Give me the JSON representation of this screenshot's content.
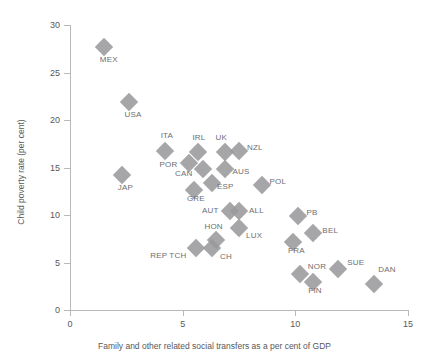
{
  "chart_data": {
    "type": "scatter",
    "title": "",
    "xlabel": "Family and other related social transfers as a per cent of GDP",
    "ylabel": "Child poverty rate (per cent)",
    "xlim": [
      0,
      15
    ],
    "ylim": [
      0,
      30
    ],
    "xticks": [
      0,
      5,
      10,
      15
    ],
    "yticks": [
      0,
      5,
      10,
      15,
      20,
      25,
      30
    ],
    "xtick_labels": [
      "0",
      "5",
      "10",
      "15"
    ],
    "ytick_labels": [
      "0",
      "5",
      "10",
      "15",
      "20",
      "25",
      "30"
    ],
    "grid": false,
    "legend": "none",
    "marker": "diamond",
    "marker_color": "#9a9a9c",
    "axis_color": "#b9b9bb",
    "text_color": "#58585a",
    "points": [
      {
        "label": "MEX",
        "x": 1.5,
        "y": 27.7,
        "lx": -4,
        "ly": 12
      },
      {
        "label": "USA",
        "x": 2.6,
        "y": 21.9,
        "lx": -4,
        "ly": 12
      },
      {
        "label": "JAP",
        "x": 2.3,
        "y": 14.2,
        "lx": -4,
        "ly": 12
      },
      {
        "label": "ITA",
        "x": 4.2,
        "y": 16.7,
        "lx": -4,
        "ly": -16
      },
      {
        "label": "POR",
        "x": 5.3,
        "y": 15.5,
        "lx": -30,
        "ly": 1
      },
      {
        "label": "IRL",
        "x": 5.7,
        "y": 16.6,
        "lx": -6,
        "ly": -15
      },
      {
        "label": "CAN",
        "x": 5.9,
        "y": 14.8,
        "lx": -28,
        "ly": 4
      },
      {
        "label": "UK",
        "x": 6.9,
        "y": 16.6,
        "lx": -10,
        "ly": -15
      },
      {
        "label": "AUS",
        "x": 6.9,
        "y": 14.8,
        "lx": 7,
        "ly": 2
      },
      {
        "label": "NZL",
        "x": 7.5,
        "y": 16.7,
        "lx": 8,
        "ly": -4
      },
      {
        "label": "ESP",
        "x": 6.3,
        "y": 13.4,
        "lx": 5,
        "ly": 3
      },
      {
        "label": "GRE",
        "x": 5.5,
        "y": 12.6,
        "lx": -7,
        "ly": 8
      },
      {
        "label": "POL",
        "x": 8.5,
        "y": 13.2,
        "lx": 8,
        "ly": -4
      },
      {
        "label": "AUT",
        "x": 7.1,
        "y": 10.4,
        "lx": -28,
        "ly": -1
      },
      {
        "label": "ALL",
        "x": 7.5,
        "y": 10.4,
        "lx": 10,
        "ly": -1
      },
      {
        "label": "LUX",
        "x": 7.5,
        "y": 8.6,
        "lx": 7,
        "ly": 7
      },
      {
        "label": "HON",
        "x": 6.5,
        "y": 7.4,
        "lx": -12,
        "ly": -14
      },
      {
        "label": "REP TCH",
        "x": 5.6,
        "y": 6.5,
        "lx": -46,
        "ly": 7
      },
      {
        "label": "CH",
        "x": 6.3,
        "y": 6.5,
        "lx": 8,
        "ly": 8
      },
      {
        "label": "PB",
        "x": 10.1,
        "y": 9.9,
        "lx": 9,
        "ly": -4
      },
      {
        "label": "BEL",
        "x": 10.8,
        "y": 8.1,
        "lx": 9,
        "ly": -3
      },
      {
        "label": "FRA",
        "x": 9.9,
        "y": 7.2,
        "lx": -5,
        "ly": 8
      },
      {
        "label": "NOR",
        "x": 10.2,
        "y": 3.8,
        "lx": 8,
        "ly": -8
      },
      {
        "label": "FIN",
        "x": 10.8,
        "y": 2.9,
        "lx": -5,
        "ly": 8
      },
      {
        "label": "SUE",
        "x": 11.9,
        "y": 4.3,
        "lx": 9,
        "ly": -7
      },
      {
        "label": "DAN",
        "x": 13.5,
        "y": 2.7,
        "lx": 4,
        "ly": -15
      }
    ]
  }
}
